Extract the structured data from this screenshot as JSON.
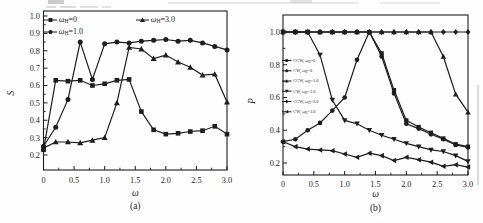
{
  "figure": {
    "background": "#ffffff",
    "ink_color": "#1d1d1d",
    "panels": [
      "(a)",
      "(b)"
    ]
  },
  "chart_data": [
    {
      "type": "line",
      "panel": "a",
      "caption": "(a)",
      "xlabel": "ω",
      "ylabel": "S",
      "xlim": [
        0,
        3.0
      ],
      "ylim": [
        0.12,
        1.03
      ],
      "grid": false,
      "legend_position": "top-left-inside",
      "xtick_values": [
        0,
        0.5,
        1.0,
        1.5,
        2.0,
        2.5,
        3.0
      ],
      "xtick_labels": [
        "0",
        "0.5",
        "1.0",
        "1.5",
        "2.0",
        "2.5",
        "3.0"
      ],
      "ytick_values": [
        1.0,
        0.9,
        0.8,
        0.7,
        0.6,
        0.5,
        0.4,
        0.3,
        0.2
      ],
      "ytick_labels": [
        "1.0",
        "0.9",
        "0.8",
        "0.7",
        "0.6",
        "0.5",
        "0.4",
        "0.3",
        "0.2"
      ],
      "x": [
        0,
        0.2,
        0.4,
        0.6,
        0.8,
        1.0,
        1.2,
        1.4,
        1.6,
        1.8,
        2.0,
        2.2,
        2.4,
        2.6,
        2.8,
        3.0
      ],
      "series": [
        {
          "name": "ωH=0",
          "marker": "square",
          "values": [
            0.23,
            0.63,
            0.625,
            0.63,
            0.6,
            0.61,
            0.63,
            0.635,
            0.45,
            0.345,
            0.32,
            0.325,
            0.335,
            0.34,
            0.365,
            0.32
          ]
        },
        {
          "name": "ωH=1.0",
          "marker": "circle",
          "values": [
            0.25,
            0.36,
            0.52,
            0.85,
            0.635,
            0.84,
            0.85,
            0.845,
            0.855,
            0.86,
            0.865,
            0.855,
            0.86,
            0.845,
            0.825,
            0.805
          ]
        },
        {
          "name": "ωH=3.0",
          "marker": "triangle-up",
          "values": [
            0.24,
            0.275,
            0.275,
            0.27,
            0.285,
            0.3,
            0.5,
            0.82,
            0.81,
            0.755,
            0.775,
            0.735,
            0.705,
            0.66,
            0.665,
            0.505
          ]
        }
      ],
      "legend": [
        {
          "marker": "square",
          "prefix": "",
          "suffix": "=0",
          "label": "ωH=0"
        },
        {
          "marker": "circle",
          "prefix": "",
          "suffix": "=1.0",
          "label": "ωH=1.0"
        },
        {
          "marker": "triangle-up",
          "prefix": "",
          "suffix": "=3.0",
          "label": "ωH=3.0"
        }
      ]
    },
    {
      "type": "line",
      "panel": "b",
      "caption": "(b)",
      "xlabel": "ω",
      "ylabel": "P",
      "xlim": [
        0,
        3.0
      ],
      "ylim": [
        0.115,
        1.1
      ],
      "grid": false,
      "legend_position": "middle-left-inside",
      "xtick_values": [
        0,
        0.5,
        1.0,
        1.5,
        2.0,
        2.5,
        3.0
      ],
      "xtick_labels": [
        "0",
        "0.5",
        "1.0",
        "1.5",
        "2.0",
        "2.5",
        "3.0"
      ],
      "ytick_values": [
        1.0,
        0.8,
        0.6,
        0.4,
        0.2
      ],
      "ytick_labels": [
        "1.0",
        "0.8",
        "0.6",
        "0.4",
        "0.2"
      ],
      "x": [
        0,
        0.2,
        0.4,
        0.6,
        0.8,
        1.0,
        1.2,
        1.4,
        1.6,
        1.8,
        2.0,
        2.2,
        2.4,
        2.6,
        2.8,
        3.0
      ],
      "series": [
        {
          "name": "CCW, ωH=0",
          "marker": "square",
          "values": [
            1.0,
            1.0,
            1.0,
            1.0,
            1.0,
            1.0,
            1.0,
            1.0,
            0.87,
            0.645,
            0.46,
            0.42,
            0.385,
            0.35,
            0.315,
            0.3
          ]
        },
        {
          "name": "CW, ωH=0",
          "marker": "circle",
          "values": [
            0.33,
            0.345,
            0.4,
            0.445,
            0.52,
            0.6,
            0.83,
            1.0,
            0.85,
            0.625,
            0.44,
            0.41,
            0.375,
            0.345,
            0.31,
            0.295
          ]
        },
        {
          "name": "CCW, ωH=1.0",
          "marker": "triangle-up",
          "values": [
            1.0,
            1.0,
            1.0,
            1.0,
            1.0,
            1.0,
            1.0,
            1.0,
            1.0,
            1.0,
            1.0,
            1.0,
            1.0,
            0.85,
            0.62,
            0.51
          ]
        },
        {
          "name": "CW, ωH=1.0",
          "marker": "triangle-down",
          "values": [
            1.0,
            1.0,
            1.0,
            0.86,
            0.585,
            0.46,
            0.44,
            0.4,
            0.37,
            0.345,
            0.32,
            0.3,
            0.28,
            0.27,
            0.245,
            0.21
          ]
        },
        {
          "name": "CCW, ωH=3.0",
          "marker": "diamond",
          "values": [
            1.0,
            1.0,
            1.0,
            1.0,
            1.0,
            1.0,
            1.0,
            1.0,
            1.0,
            1.0,
            1.0,
            1.0,
            1.0,
            1.0,
            1.0,
            1.0
          ]
        },
        {
          "name": "CW, ωH=3.0",
          "marker": "triangle-left",
          "values": [
            0.33,
            0.3,
            0.285,
            0.28,
            0.275,
            0.255,
            0.235,
            0.26,
            0.245,
            0.215,
            0.235,
            0.22,
            0.205,
            0.18,
            0.19,
            0.175
          ]
        }
      ],
      "legend": [
        {
          "marker": "square",
          "prefix": "CCW, ",
          "suffix": "=0",
          "label": "CCW, ωH=0"
        },
        {
          "marker": "circle",
          "prefix": "CW, ",
          "suffix": "=0",
          "label": "CW, ωH=0"
        },
        {
          "marker": "triangle-up",
          "prefix": "CCW, ",
          "suffix": "=1.0",
          "label": "CCW, ωH=1.0"
        },
        {
          "marker": "triangle-down",
          "prefix": "CW, ",
          "suffix": "=1.0",
          "label": "CW, ωH=1.0"
        },
        {
          "marker": "diamond",
          "prefix": "CCW, ",
          "suffix": "=3.0",
          "label": "CCW, ωH=3.0"
        },
        {
          "marker": "triangle-left",
          "prefix": "CW, ",
          "suffix": "=3.0",
          "label": "CW, ωH=3.0"
        }
      ]
    }
  ]
}
